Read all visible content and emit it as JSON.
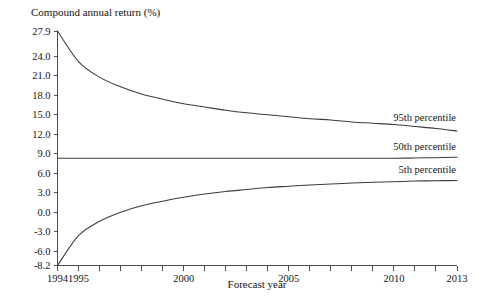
{
  "chart_data": {
    "type": "line",
    "title": "Compound annual return (%)",
    "xlabel": "Forecast year",
    "ylabel": "Compound annual return (%)",
    "xlim": [
      1994,
      2013
    ],
    "ylim": [
      -8.2,
      27.9
    ],
    "grid": false,
    "legend_position": "inline-right",
    "x": [
      1994,
      1995,
      1996,
      1997,
      1998,
      1999,
      2000,
      2001,
      2002,
      2003,
      2004,
      2005,
      2006,
      2007,
      2008,
      2009,
      2010,
      2011,
      2012,
      2013
    ],
    "y_ticks": [
      -8.2,
      -6.0,
      -3.0,
      0.0,
      3.0,
      6.0,
      9.0,
      12.0,
      15.0,
      18.0,
      21.0,
      24.0,
      27.9
    ],
    "y_tick_labels": [
      "-8.2",
      "-6.0",
      "-3.0",
      "0.0",
      "3.0",
      "6.0",
      "9.0",
      "12.0",
      "15.0",
      "18.0",
      "21.0",
      "24.0",
      "27.9"
    ],
    "x_ticks": [
      1994,
      1995,
      1996,
      1997,
      1998,
      1999,
      2000,
      2001,
      2002,
      2003,
      2004,
      2005,
      2006,
      2007,
      2008,
      2009,
      2010,
      2011,
      2012,
      2013
    ],
    "x_tick_labels_shown": [
      {
        "value": 1994,
        "label": "1994"
      },
      {
        "value": 1995,
        "label": "1995"
      },
      {
        "value": 2000,
        "label": "2000"
      },
      {
        "value": 2005,
        "label": "2005"
      },
      {
        "value": 2010,
        "label": "2010"
      },
      {
        "value": 2013,
        "label": "2013"
      }
    ],
    "series": [
      {
        "name": "95th percentile",
        "label": "95th percentile",
        "values": [
          27.9,
          23.2,
          20.8,
          19.3,
          18.2,
          17.4,
          16.7,
          16.2,
          15.7,
          15.3,
          15.0,
          14.7,
          14.4,
          14.2,
          13.9,
          13.7,
          13.5,
          13.2,
          12.9,
          12.5
        ]
      },
      {
        "name": "50th percentile",
        "label": "50th percentile",
        "values": [
          8.3,
          8.3,
          8.3,
          8.3,
          8.3,
          8.3,
          8.3,
          8.3,
          8.3,
          8.3,
          8.3,
          8.3,
          8.3,
          8.3,
          8.3,
          8.3,
          8.3,
          8.35,
          8.4,
          8.45
        ]
      },
      {
        "name": "5th percentile",
        "label": "5th percentile",
        "values": [
          -8.2,
          -3.6,
          -1.4,
          0.0,
          1.0,
          1.7,
          2.3,
          2.8,
          3.2,
          3.5,
          3.8,
          4.0,
          4.2,
          4.35,
          4.5,
          4.6,
          4.7,
          4.8,
          4.85,
          4.9
        ]
      }
    ]
  }
}
